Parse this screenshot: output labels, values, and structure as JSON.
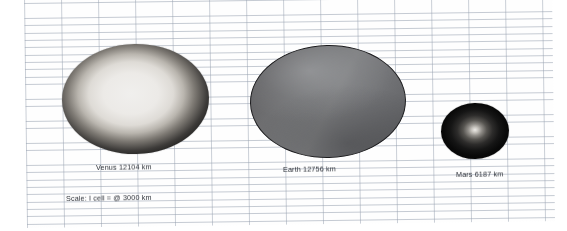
{
  "figure": {
    "medium": "graph-paper-drawing",
    "paper": {
      "background_color": "#fefefe",
      "grid_line_color": "#96a0af",
      "cell_width_px": 37,
      "cell_height_px": 7.35
    }
  },
  "chart_data": {
    "type": "scatter",
    "title": "",
    "xlabel": "",
    "ylabel": "",
    "categories": [
      "Venus",
      "Earth",
      "Mars"
    ],
    "values": [
      12104,
      12756,
      6187
    ],
    "units": "km",
    "scale_note": "1 cell = @ 3000 km",
    "grid": true,
    "legend": "none"
  },
  "planets": [
    {
      "id": "venus",
      "name": "Venus",
      "diameter_km": 12104,
      "label": "Venus 12104 km",
      "shading": "radial-bright-core-dark-rim",
      "core_color": "#f0efed",
      "rim_color": "#0d0d0d",
      "rendered_width_px": 147,
      "rendered_height_px": 110
    },
    {
      "id": "earth",
      "name": "Earth",
      "diameter_km": 12756,
      "label": "Earth 12756 km",
      "shading": "linear-diagonal-mid-grey",
      "fill_color": "#77787a",
      "outline_color": "#1b1b1d",
      "rendered_width_px": 156,
      "rendered_height_px": 113
    },
    {
      "id": "mars",
      "name": "Mars",
      "diameter_km": 6187,
      "label": "Mars 6187 km",
      "shading": "radial-small-bright-centre-dark-body",
      "core_color": "#eceae6",
      "body_color": "#090909",
      "rendered_width_px": 68,
      "rendered_height_px": 56
    }
  ],
  "labels": {
    "venus": "Venus 12104 km",
    "earth": "Earth 12756 km",
    "mars": "Mars 6187 km",
    "scale": "Scale: I cell = @ 3000 km"
  }
}
